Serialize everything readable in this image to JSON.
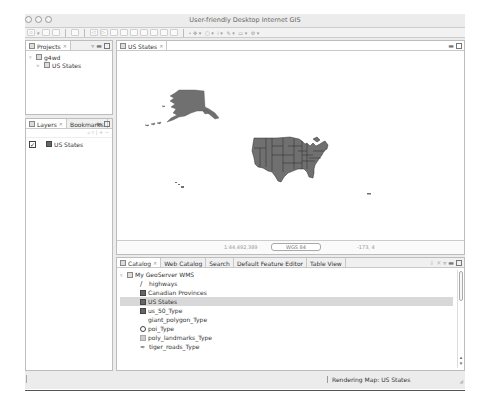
{
  "window": {
    "title": "User-friendly Desktop Internet GIS"
  },
  "toolbar": {
    "groups": [
      "new",
      "save",
      "print",
      "nav",
      "pan",
      "zoom",
      "select",
      "edit",
      "info"
    ]
  },
  "projects": {
    "tab_label": "Projects",
    "tree": [
      {
        "label": "g4wd",
        "level": 0,
        "expanded": true,
        "icon": "project-icon"
      },
      {
        "label": "US States",
        "level": 1,
        "icon": "map-icon"
      }
    ]
  },
  "layers": {
    "tabs": [
      {
        "label": "Layers",
        "active": true
      },
      {
        "label": "Bookmarks",
        "active": false
      }
    ],
    "items": [
      {
        "label": "US States",
        "checked": true
      }
    ]
  },
  "map_editor": {
    "tab_label": "US States",
    "status": {
      "scale": "1:44,492,389",
      "crs": "WGS 84",
      "coords": "-173, 4"
    }
  },
  "catalog": {
    "tabs": [
      {
        "label": "Catalog",
        "active": true
      },
      {
        "label": "Web Catalog",
        "active": false
      },
      {
        "label": "Search",
        "active": false
      },
      {
        "label": "Default Feature Editor",
        "active": false
      },
      {
        "label": "Table View",
        "active": false
      }
    ],
    "root": "My GeoServer WMS",
    "items": [
      {
        "label": "highways",
        "icon": "line-icon"
      },
      {
        "label": "Canadian Provinces",
        "icon": "polygon-icon"
      },
      {
        "label": "US States",
        "icon": "polygon-icon",
        "selected": true
      },
      {
        "label": "us_50_Type",
        "icon": "polygon-icon"
      },
      {
        "label": "giant_polygon_Type",
        "icon": "blank-icon"
      },
      {
        "label": "poi_Type",
        "icon": "point-icon"
      },
      {
        "label": "poly_landmarks_Type",
        "icon": "polygon-light-icon"
      },
      {
        "label": "tiger_roads_Type",
        "icon": "road-icon"
      }
    ]
  },
  "statusbar": {
    "message": "Rendering Map: US States"
  },
  "colors": {
    "map_fill": "#707070",
    "map_stroke": "#2a2a2a",
    "chrome": "#ececec",
    "selection": "#d8d8d8"
  }
}
